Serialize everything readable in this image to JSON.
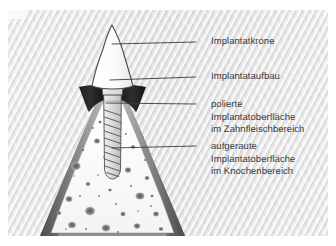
{
  "figure": {
    "language": "de",
    "background_color": "#ffffff",
    "panel_color": "#e6e6e6",
    "line_color": "#3b3b3b",
    "text_color": "#3b3b3b"
  },
  "labels": [
    {
      "id": "implantatkrone",
      "text": "Implantatkrone",
      "x": 211,
      "y": 36,
      "leader_from_x": 196,
      "leader_from_y": 42,
      "leader_to_x": 112,
      "leader_to_y": 44
    },
    {
      "id": "implantataufbau",
      "text": "Implantataufbau",
      "x": 211,
      "y": 71,
      "leader_from_x": 196,
      "leader_from_y": 77,
      "leader_to_x": 110,
      "leader_to_y": 80
    },
    {
      "id": "polierte-oberflaeche",
      "text": "polierte\nImplantatoberfläche\nim Zahnfleischbereich",
      "x": 211,
      "y": 99,
      "leader_from_x": 196,
      "leader_from_y": 104,
      "leader_to_x": 106,
      "leader_to_y": 103
    },
    {
      "id": "aufgeraute-oberflaeche",
      "text": "aufgeraute\nImplantatoberfläche\nim Knochenbereich",
      "x": 211,
      "y": 141,
      "leader_from_x": 196,
      "leader_from_y": 146,
      "leader_to_x": 112,
      "leader_to_y": 148
    }
  ],
  "anatomy": {
    "crown": {
      "name": "Implantatkrone",
      "fill": "#fdfdfd",
      "stroke": "#4a4a4a"
    },
    "abutment": {
      "name": "Implantataufbau",
      "fill": "#e4e4e4",
      "stroke": "#4a4a4a"
    },
    "gingiva": {
      "name": "Zahnfleisch",
      "fill": "#2a2a2a"
    },
    "cortical_bone": {
      "name": "Kortikalis",
      "fill": "#9a9a9a"
    },
    "trabecular_bone": {
      "name": "Spongiosa",
      "fill": "#fbfbfb",
      "speck_fill": "#6e6e6e"
    },
    "implant": {
      "name": "Implantat",
      "fill": "#d8d8d8",
      "stroke": "#555555",
      "thread_turns": 10
    }
  }
}
